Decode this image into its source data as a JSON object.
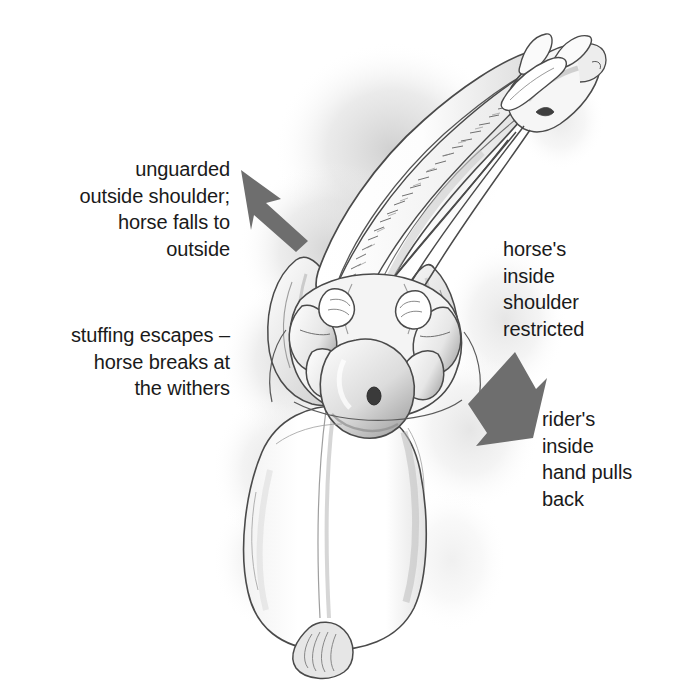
{
  "illustration": {
    "title": "Horse and rider viewed from above",
    "description": "Pencil sketch seen from the rider's overhead viewpoint showing a horse's neck, mane and head bent to the inside, with the rider's shoulders, arms, hands and reins, and the horse's hindquarters and tail below.",
    "background_color": "#ffffff",
    "ink_color": "#3c3c3c",
    "shadow_color": "#b9b9b9",
    "parts": [
      "horse-head",
      "horse-ears",
      "browband",
      "horse-neck",
      "horse-mane",
      "horse-shoulder-left",
      "horse-shoulder-right",
      "rider-head",
      "rider-shoulders",
      "rider-arms",
      "rider-hands",
      "reins",
      "saddle",
      "horse-barrel",
      "horse-hindquarters",
      "horse-tail"
    ]
  },
  "annotations": [
    {
      "id": "unguarded-outside-shoulder",
      "text": "unguarded\noutside shoulder;\nhorse falls to\noutside",
      "align": "right",
      "color": "#1a1a1a"
    },
    {
      "id": "stuffing-escapes",
      "text": "stuffing escapes –\nhorse breaks at\nthe withers",
      "align": "right",
      "color": "#1a1a1a"
    },
    {
      "id": "horse-inside-shoulder-restricted",
      "text": "horse's\ninside\nshoulder\nrestricted",
      "align": "left",
      "color": "#1a1a1a"
    },
    {
      "id": "rider-inside-hand-pulls-back",
      "text": "rider's\ninside\nhand pulls\nback",
      "align": "left",
      "color": "#1a1a1a"
    }
  ],
  "arrows": [
    {
      "id": "arrow-to-outside-shoulder",
      "direction": "up-left",
      "color": "#6e6e6e",
      "points_to": "horse outside shoulder"
    },
    {
      "id": "arrow-rein-pull-back",
      "direction": "down-left",
      "color": "#6e6e6e",
      "points_to": "rider inside hand"
    }
  ]
}
